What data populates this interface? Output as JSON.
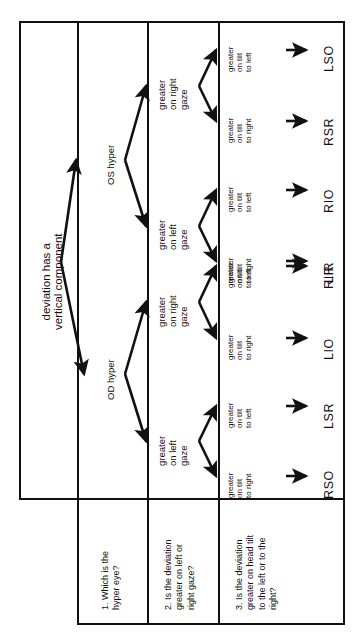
{
  "columns": [
    {
      "id": "col-title",
      "question": ""
    },
    {
      "id": "col-step1",
      "question": "1. Which is the hyper eye?"
    },
    {
      "id": "col-step2",
      "question": "2. Is the deviation greater on left or right gaze?"
    },
    {
      "id": "col-step3",
      "question": "3. Is the deviation greater on head tilt to the left or to the right?"
    }
  ],
  "questions": {
    "q1_line1": "1. Which is the",
    "q1_line2": "hyper eye?",
    "q2_line1": "2. Is the deviation",
    "q2_line2": "greater on left or",
    "q2_line3": "right gaze?",
    "q3_line1": "3. Is the deviation",
    "q3_line2": "greater on head tilt",
    "q3_line3": "to the left or to the",
    "q3_line4": "right?"
  },
  "hyper_nodes": [
    {
      "id": "os-hyper",
      "label": "OS hyper"
    },
    {
      "id": "od-hyper",
      "label": "OD hyper"
    }
  ],
  "gaze_nodes": [
    {
      "id": "os-right-gaze",
      "l1": "greater",
      "l2": "on right",
      "l3": "gaze"
    },
    {
      "id": "os-left-gaze",
      "l1": "greater",
      "l2": "on left",
      "l3": "gaze"
    },
    {
      "id": "od-right-gaze",
      "l1": "greater",
      "l2": "on right",
      "l3": "gaze"
    },
    {
      "id": "od-left-gaze",
      "l1": "greater",
      "l2": "on left",
      "l3": "gaze"
    }
  ],
  "tilt_nodes": [
    {
      "id": "tilt-1",
      "l1": "greater",
      "l2": "on tilt",
      "l3": "to left",
      "muscle": "LSO"
    },
    {
      "id": "tilt-2",
      "l1": "greater",
      "l2": "on tilt",
      "l3": "to right",
      "muscle": "RSR"
    },
    {
      "id": "tilt-3",
      "l1": "greater",
      "l2": "on tilt",
      "l3": "to left",
      "muscle": "RIO"
    },
    {
      "id": "tilt-4",
      "l1": "greater",
      "l2": "on tilt",
      "l3": "to right",
      "muscle": "LIR"
    },
    {
      "id": "tilt-5",
      "l1": "greater",
      "l2": "on tilt",
      "l3": "to left",
      "muscle": "RIR"
    },
    {
      "id": "tilt-6",
      "l1": "greater",
      "l2": "on tilt",
      "l3": "to right",
      "muscle": "LIO"
    },
    {
      "id": "tilt-7",
      "l1": "greater",
      "l2": "on tilt",
      "l3": "to left",
      "muscle": "LSR"
    },
    {
      "id": "tilt-8",
      "l1": "greater",
      "l2": "on tilt",
      "l3": "to right",
      "muscle": "RSO"
    }
  ],
  "colors": {
    "ink": "#111111",
    "paper": "#ffffff"
  }
}
